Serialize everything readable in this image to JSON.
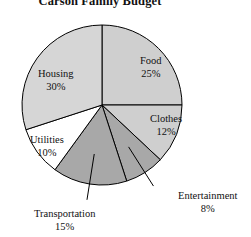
{
  "chart_data": {
    "type": "pie",
    "title": "Carson Family Budget",
    "xlabel": "",
    "ylabel": "",
    "legend_position": "none",
    "grid": false,
    "start_angle_deg": 0,
    "direction": "clockwise",
    "categories": [
      "Food",
      "Clothes",
      "Entertainment",
      "Transportation",
      "Utilities",
      "Housing"
    ],
    "values": [
      25,
      12,
      8,
      15,
      10,
      30
    ],
    "unit": "%",
    "slices": [
      {
        "name": "Food",
        "label": "Food",
        "value": 25,
        "pct_text": "25%",
        "fill": "#cfcfcf",
        "label_placement": "inside",
        "label_x": 140,
        "label_y": 55,
        "leader": false
      },
      {
        "name": "Clothes",
        "label": "Clothes",
        "value": 12,
        "pct_text": "12%",
        "fill": "#cfcfcf",
        "label_placement": "inside",
        "label_x": 150,
        "label_y": 113,
        "leader": false
      },
      {
        "name": "Entertainment",
        "label": "Entertainment",
        "value": 8,
        "pct_text": "8%",
        "fill": "#a8a8a8",
        "label_placement": "outside",
        "label_x": 178,
        "label_y": 190,
        "leader": true
      },
      {
        "name": "Transportation",
        "label": "Transportation",
        "value": 15,
        "pct_text": "15%",
        "fill": "#a8a8a8",
        "label_placement": "outside",
        "label_x": 34,
        "label_y": 208,
        "leader": true
      },
      {
        "name": "Utilities",
        "label": "Utilities",
        "value": 10,
        "pct_text": "10%",
        "fill": "#ffffff",
        "label_placement": "inside",
        "label_x": 30,
        "label_y": 134,
        "leader": false
      },
      {
        "name": "Housing",
        "label": "Housing",
        "value": 30,
        "pct_text": "30%",
        "fill": "#d6d6d6",
        "label_placement": "inside",
        "label_x": 38,
        "label_y": 68,
        "leader": false
      }
    ],
    "geometry": {
      "center_x": 102,
      "center_y": 105,
      "radius": 80,
      "stroke": "#000000",
      "stroke_width": 1
    }
  }
}
